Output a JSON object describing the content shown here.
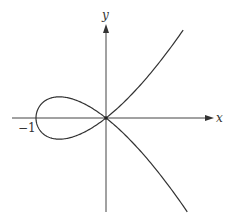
{
  "chart_data": {
    "type": "line",
    "title": "",
    "xlabel": "x",
    "ylabel": "y",
    "equation": "y^2 = x^2 (x + 1)",
    "tick_labels": [
      {
        "axis": "x",
        "value": -1,
        "label": "−1"
      }
    ],
    "xlim": [
      -1.35,
      1.55
    ],
    "ylim": [
      -1.7,
      1.75
    ],
    "grid": false,
    "legend": null,
    "series": [
      {
        "name": "upper branch",
        "x": [
          -1.0,
          -0.9,
          -0.8,
          -0.667,
          -0.5,
          -0.3,
          0.0,
          0.3,
          0.6,
          0.9,
          1.1
        ],
        "y": [
          0.0,
          0.285,
          0.358,
          0.385,
          0.354,
          0.251,
          0.0,
          0.342,
          0.759,
          1.242,
          1.594
        ]
      },
      {
        "name": "lower branch",
        "x": [
          -1.0,
          -0.9,
          -0.8,
          -0.667,
          -0.5,
          -0.3,
          0.0,
          0.3,
          0.6,
          0.9,
          1.17
        ],
        "y": [
          0.0,
          -0.285,
          -0.358,
          -0.385,
          -0.354,
          -0.251,
          0.0,
          -0.342,
          -0.759,
          -1.242,
          -1.724
        ]
      }
    ],
    "annotations": [
      {
        "text": "node at origin",
        "x": 0,
        "y": 0
      }
    ],
    "colors": {
      "curve": "#333333",
      "axis": "#444444",
      "background": "#ffffff"
    }
  },
  "labels": {
    "x_axis": "x",
    "y_axis": "y",
    "tick_neg1": "−1"
  }
}
